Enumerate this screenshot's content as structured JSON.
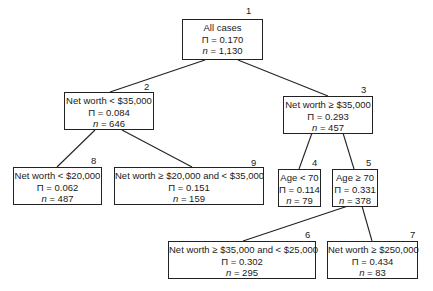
{
  "tree": {
    "nodes": [
      {
        "id": "1",
        "label": "1",
        "condition": "All cases",
        "pi": "Π = 0.170",
        "n_label": "n",
        "n_value": " = 1,130"
      },
      {
        "id": "2",
        "label": "2",
        "condition": "Net worth < $35,000",
        "pi": "Π = 0.084",
        "n_label": "n",
        "n_value": " = 646"
      },
      {
        "id": "3",
        "label": "3",
        "condition": "Net worth ≥ $35,000",
        "pi": "Π = 0.293",
        "n_label": "n",
        "n_value": " = 457"
      },
      {
        "id": "4",
        "label": "4",
        "condition": "Age < 70",
        "pi": "Π = 0.114",
        "n_label": "n",
        "n_value": " = 79"
      },
      {
        "id": "5",
        "label": "5",
        "condition": "Age ≥ 70",
        "pi": "Π = 0.331",
        "n_label": "n",
        "n_value": " = 378"
      },
      {
        "id": "6",
        "label": "6",
        "condition": "Net worth ≥ $35,000 and < $25,000",
        "pi": "Π = 0.302",
        "n_label": "n",
        "n_value": " = 295"
      },
      {
        "id": "7",
        "label": "7",
        "condition": "Net worth ≥ $250,000",
        "pi": "Π = 0.434",
        "n_label": "n",
        "n_value": " = 83"
      },
      {
        "id": "8",
        "label": "8",
        "condition": "Net worth < $20,000",
        "pi": "Π = 0.062",
        "n_label": "n",
        "n_value": " = 487"
      },
      {
        "id": "9",
        "label": "9",
        "condition": "Net worth ≥ $20,000 and < $35,000",
        "pi": "Π = 0.151",
        "n_label": "n",
        "n_value": " = 159"
      }
    ],
    "edges": [
      {
        "from": "1",
        "to": "2"
      },
      {
        "from": "1",
        "to": "3"
      },
      {
        "from": "2",
        "to": "8"
      },
      {
        "from": "2",
        "to": "9"
      },
      {
        "from": "3",
        "to": "4"
      },
      {
        "from": "3",
        "to": "5"
      },
      {
        "from": "5",
        "to": "6"
      },
      {
        "from": "5",
        "to": "7"
      }
    ]
  }
}
